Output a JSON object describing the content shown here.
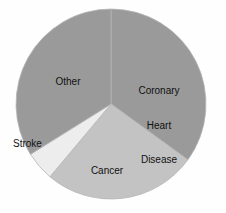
{
  "chart_data": {
    "type": "pie",
    "title": "",
    "subtitle": "",
    "xlabel": "",
    "ylabel": "",
    "grid": false,
    "legend_position": "none",
    "labels_placement": "inside-slices",
    "categories": [
      "Coronary Heart Disease",
      "Cancer",
      "Stroke",
      "Other"
    ],
    "values": [
      35,
      26,
      5,
      34
    ],
    "units": "percent",
    "start_angle_deg": 0,
    "direction": "clockwise",
    "slices": [
      {
        "name": "Coronary Heart Disease",
        "label_lines": [
          "Coronary",
          "Heart",
          "Disease"
        ],
        "value": 35,
        "color": "#9a9a9a",
        "start_deg": 0,
        "end_deg": 126
      },
      {
        "name": "Cancer",
        "label_lines": [
          "Cancer"
        ],
        "value": 26,
        "color": "#c3c3c3",
        "start_deg": 126,
        "end_deg": 220
      },
      {
        "name": "Stroke",
        "label_lines": [
          "Stroke"
        ],
        "value": 5,
        "color": "#ededed",
        "start_deg": 220,
        "end_deg": 238
      },
      {
        "name": "Other",
        "label_lines": [
          "Other"
        ],
        "value": 34,
        "color": "#9a9a9a",
        "start_deg": 238,
        "end_deg": 360
      }
    ],
    "geometry": {
      "center_x": 111,
      "center_y": 104,
      "radius": 95
    },
    "colors": {
      "background": "#fefefe",
      "text": "#111111",
      "outline": "#b5b5b5",
      "coronary_heart_disease": "#9a9a9a",
      "cancer": "#c3c3c3",
      "stroke": "#ededed",
      "other": "#9a9a9a"
    }
  }
}
